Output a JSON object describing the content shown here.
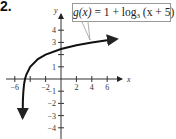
{
  "problem_number": "2.",
  "callout": {
    "function_name": "g(x)",
    "equals": " = 1 + log",
    "base": "3",
    "argument": " (x + 5)",
    "full_text": "g(x) = 1 + log3 (x + 5)"
  },
  "chart_data": {
    "type": "line",
    "title": "",
    "function": "g(x) = 1 + log_3(x + 5)",
    "xlabel": "x",
    "ylabel": "y",
    "x_ticks": [
      -6,
      -4,
      -2,
      2,
      4,
      6
    ],
    "x_tick_labels": [
      "-6",
      "-2",
      "2",
      "4",
      "6"
    ],
    "y_ticks": [
      -4,
      -3,
      -2,
      -1,
      1,
      2,
      3,
      4
    ],
    "y_tick_labels": [
      "-4",
      "-3",
      "-2",
      "-1",
      "1",
      "3",
      "4"
    ],
    "xlim": [
      -7,
      8
    ],
    "ylim": [
      -4.5,
      5
    ],
    "vertical_asymptote": -5,
    "grid": false,
    "series": [
      {
        "name": "g(x)",
        "x": [
          -4.99,
          -4.95,
          -4.9,
          -4.8,
          -4.67,
          -4.5,
          -4,
          -3,
          -2,
          0,
          2,
          4,
          6,
          7
        ],
        "y": [
          -3.19,
          -1.73,
          -1.1,
          -0.46,
          0.0,
          0.37,
          1.0,
          1.63,
          2.0,
          2.46,
          2.77,
          3.0,
          3.18,
          3.26
        ]
      }
    ]
  },
  "axis": {
    "x_label": "x",
    "y_label": "y",
    "x_labels": [
      "-6",
      "-2",
      "2",
      "4",
      "6"
    ],
    "y_labels": [
      "4",
      "3",
      "1",
      "-1",
      "-2",
      "-3",
      "-4"
    ]
  },
  "colors": {
    "curve": "#111111",
    "axis": "#333333",
    "callout_border": "#9a9a9a"
  }
}
